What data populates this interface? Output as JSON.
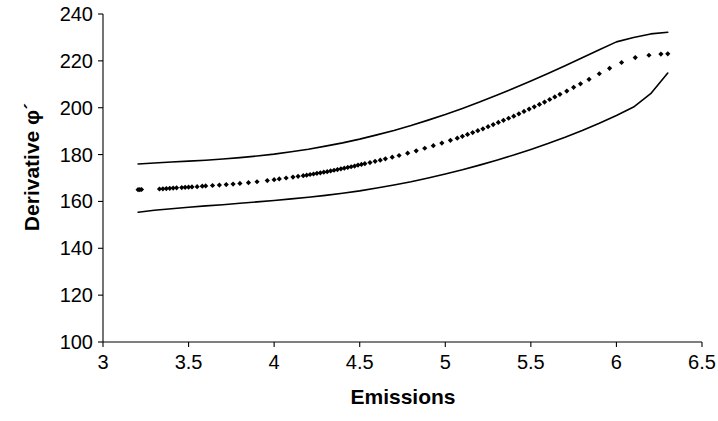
{
  "chart_data": {
    "type": "scatter",
    "title": "",
    "xlabel": "Emissions",
    "ylabel": "Derivative φ´",
    "xlim": [
      3,
      6.5
    ],
    "ylim": [
      100,
      240
    ],
    "grid": false,
    "legend": "none",
    "xticks": [
      "3",
      "3.5",
      "4",
      "4.5",
      "5",
      "5.5",
      "6",
      "6.5"
    ],
    "xtick_values": [
      3,
      3.5,
      4,
      4.5,
      5,
      5.5,
      6,
      6.5
    ],
    "yticks": [
      "100",
      "120",
      "140",
      "160",
      "180",
      "200",
      "220",
      "240"
    ],
    "ytick_values": [
      100,
      120,
      140,
      160,
      180,
      200,
      220,
      240
    ],
    "axis_color": "#000000",
    "marker_color": "#000000",
    "line_color": "#000000",
    "series": [
      {
        "name": "Upper confidence band",
        "type": "line",
        "x": [
          3.205,
          3.3,
          3.4,
          3.5,
          3.6,
          3.7,
          3.8,
          3.9,
          4.0,
          4.1,
          4.2,
          4.3,
          4.4,
          4.5,
          4.6,
          4.7,
          4.8,
          4.9,
          5.0,
          5.1,
          5.2,
          5.3,
          5.4,
          5.5,
          5.6,
          5.7,
          5.8,
          5.9,
          6.0,
          6.1,
          6.2,
          6.3
        ],
        "y": [
          176.0,
          176.4,
          176.8,
          177.2,
          177.6,
          178.1,
          178.7,
          179.4,
          180.2,
          181.2,
          182.3,
          183.6,
          185.0,
          186.6,
          188.4,
          190.3,
          192.4,
          194.7,
          197.1,
          199.7,
          202.4,
          205.3,
          208.3,
          211.4,
          214.6,
          217.9,
          221.3,
          224.7,
          228.1,
          230.0,
          231.5,
          232.2
        ]
      },
      {
        "name": "Fitted values (scatter)",
        "type": "scatter",
        "x": [
          3.205,
          3.215,
          3.225,
          3.33,
          3.35,
          3.37,
          3.39,
          3.41,
          3.43,
          3.46,
          3.48,
          3.5,
          3.52,
          3.55,
          3.58,
          3.6,
          3.64,
          3.68,
          3.72,
          3.76,
          3.8,
          3.85,
          3.9,
          3.96,
          4.0,
          4.03,
          4.07,
          4.11,
          4.14,
          4.17,
          4.19,
          4.21,
          4.23,
          4.25,
          4.27,
          4.29,
          4.31,
          4.33,
          4.35,
          4.37,
          4.39,
          4.41,
          4.43,
          4.45,
          4.47,
          4.49,
          4.51,
          4.53,
          4.56,
          4.59,
          4.62,
          4.65,
          4.69,
          4.73,
          4.78,
          4.83,
          4.88,
          4.93,
          4.98,
          5.03,
          5.07,
          5.1,
          5.13,
          5.16,
          5.19,
          5.22,
          5.25,
          5.28,
          5.31,
          5.34,
          5.37,
          5.4,
          5.43,
          5.46,
          5.49,
          5.52,
          5.55,
          5.58,
          5.61,
          5.64,
          5.67,
          5.71,
          5.75,
          5.79,
          5.84,
          5.9,
          5.96,
          6.03,
          6.11,
          6.19,
          6.26,
          6.3
        ],
        "y": [
          165.0,
          165.0,
          165.1,
          165.3,
          165.4,
          165.5,
          165.6,
          165.7,
          165.8,
          165.9,
          166.0,
          166.1,
          166.2,
          166.3,
          166.5,
          166.6,
          166.8,
          167.0,
          167.2,
          167.4,
          167.7,
          168.0,
          168.4,
          168.9,
          169.3,
          169.6,
          170.0,
          170.4,
          170.7,
          171.0,
          171.2,
          171.5,
          171.7,
          172.0,
          172.2,
          172.5,
          172.7,
          173.0,
          173.3,
          173.6,
          173.9,
          174.2,
          174.5,
          174.8,
          175.1,
          175.5,
          175.8,
          176.1,
          176.6,
          177.1,
          177.6,
          178.2,
          178.9,
          179.6,
          180.6,
          181.6,
          182.7,
          183.8,
          184.9,
          186.1,
          187.0,
          187.8,
          188.6,
          189.4,
          190.2,
          191.0,
          191.9,
          192.8,
          193.7,
          194.6,
          195.5,
          196.4,
          197.4,
          198.4,
          199.4,
          200.4,
          201.4,
          202.4,
          203.5,
          204.6,
          205.7,
          207.1,
          208.7,
          210.2,
          212.1,
          214.5,
          216.8,
          219.3,
          221.4,
          222.4,
          222.9,
          223.0
        ]
      },
      {
        "name": "Lower confidence band",
        "type": "line",
        "x": [
          3.205,
          3.3,
          3.4,
          3.5,
          3.6,
          3.7,
          3.8,
          3.9,
          4.0,
          4.1,
          4.2,
          4.3,
          4.4,
          4.5,
          4.6,
          4.7,
          4.8,
          4.9,
          5.0,
          5.1,
          5.2,
          5.3,
          5.4,
          5.5,
          5.6,
          5.7,
          5.8,
          5.9,
          6.0,
          6.1,
          6.2,
          6.3
        ],
        "y": [
          155.4,
          156.2,
          156.9,
          157.5,
          158.1,
          158.6,
          159.2,
          159.8,
          160.4,
          161.1,
          161.8,
          162.6,
          163.5,
          164.5,
          165.7,
          167.0,
          168.4,
          170.0,
          171.7,
          173.5,
          175.5,
          177.6,
          179.8,
          182.2,
          184.7,
          187.4,
          190.3,
          193.4,
          196.7,
          200.3,
          206.0,
          214.8
        ]
      }
    ]
  }
}
